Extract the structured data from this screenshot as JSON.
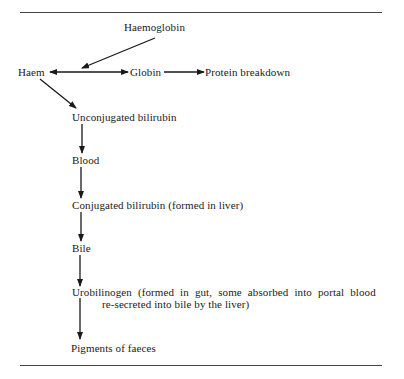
{
  "diagram": {
    "type": "flowchart",
    "nodes": {
      "haemoglobin": "Haemoglobin",
      "haem": "Haem",
      "globin": "Globin",
      "protein_breakdown": "Protein breakdown",
      "unconjugated_bilirubin": "Unconjugated bilirubin",
      "blood": "Blood",
      "conjugated_bilirubin": "Conjugated bilirubin (formed in liver)",
      "bile": "Bile",
      "urobilinogen_line1": "Urobilinogen (formed in gut, some absorbed into portal blood",
      "urobilinogen_line2": "re-secreted into bile by the liver)",
      "pigments_of_faeces": "Pigments of faeces"
    },
    "edges": [
      {
        "from": "Haemoglobin",
        "to": "Haem/Globin split"
      },
      {
        "from": "split",
        "to": "Haem"
      },
      {
        "from": "split",
        "to": "Globin"
      },
      {
        "from": "Globin",
        "to": "Protein breakdown"
      },
      {
        "from": "Haem",
        "to": "Unconjugated bilirubin"
      },
      {
        "from": "Unconjugated bilirubin",
        "to": "Blood"
      },
      {
        "from": "Blood",
        "to": "Conjugated bilirubin (formed in liver)"
      },
      {
        "from": "Conjugated bilirubin (formed in liver)",
        "to": "Bile"
      },
      {
        "from": "Bile",
        "to": "Urobilinogen"
      },
      {
        "from": "Urobilinogen",
        "to": "Pigments of faeces"
      }
    ]
  }
}
